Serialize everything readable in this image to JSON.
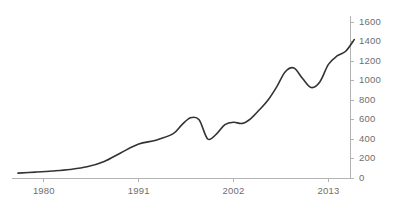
{
  "chart_data": {
    "type": "line",
    "title": "",
    "subtitle": "",
    "xlabel": "",
    "ylabel": "",
    "xlim": [
      1977,
      2015.5
    ],
    "ylim": [
      0,
      1600
    ],
    "grid": false,
    "legend": null,
    "legend_position": "none",
    "y_axis_side": "right",
    "x_ticks": [
      1980,
      1991,
      2002,
      2013
    ],
    "x_tick_labels": [
      "1980",
      "1991",
      "2002",
      "2013"
    ],
    "y_ticks": [
      0,
      200,
      400,
      600,
      800,
      1000,
      1200,
      1400,
      1600
    ],
    "y_tick_labels": [
      "0",
      "200",
      "400",
      "600",
      "800",
      "1000",
      "1200",
      "1400",
      "1600"
    ],
    "series": [
      {
        "name": "",
        "color": "#333333",
        "x": [
          1977,
          1978,
          1979,
          1980,
          1981,
          1982,
          1983,
          1984,
          1985,
          1986,
          1987,
          1988,
          1989,
          1990,
          1991,
          1992,
          1993,
          1994,
          1995,
          1996,
          1997,
          1998,
          1999,
          2000,
          2001,
          2002,
          2003,
          2004,
          2005,
          2006,
          2007,
          2008,
          2009,
          2010,
          2011,
          2012,
          2013,
          2014,
          2015
        ],
        "values": [
          50,
          55,
          62,
          70,
          76,
          82,
          90,
          100,
          118,
          145,
          180,
          225,
          275,
          320,
          352,
          372,
          392,
          420,
          462,
          540,
          612,
          600,
          425,
          392,
          500,
          565,
          578,
          572,
          620,
          720,
          830,
          960,
          1090,
          1128,
          1010,
          928,
          960,
          1105,
          1225
        ],
        "extra_x": [
          2016,
          2017
        ],
        "extra_values": [
          1278,
          1300
        ]
      }
    ],
    "series_full": {
      "points": [
        [
          1977,
          50
        ],
        [
          1979,
          60
        ],
        [
          1981,
          72
        ],
        [
          1983,
          88
        ],
        [
          1985,
          115
        ],
        [
          1987,
          170
        ],
        [
          1989,
          262
        ],
        [
          1991,
          348
        ],
        [
          1993,
          388
        ],
        [
          1995,
          455
        ],
        [
          1996,
          545
        ],
        [
          1997,
          618
        ],
        [
          1998,
          598
        ],
        [
          1999,
          400
        ],
        [
          2000,
          450
        ],
        [
          2001,
          548
        ],
        [
          2002,
          572
        ],
        [
          2003,
          560
        ],
        [
          2004,
          610
        ],
        [
          2005,
          700
        ],
        [
          2006,
          800
        ],
        [
          2007,
          935
        ],
        [
          2008,
          1090
        ],
        [
          2009,
          1128
        ],
        [
          2010,
          1020
        ],
        [
          2011,
          928
        ],
        [
          2012,
          985
        ],
        [
          2013,
          1165
        ],
        [
          2014,
          1252
        ],
        [
          2015,
          1300
        ],
        [
          2016,
          1420
        ]
      ]
    },
    "annotations": [],
    "line_color": "#333333",
    "axis_color": "#b3b3b3",
    "tick_label_color": "#6e6e6e",
    "background_color": "#ffffff"
  },
  "layout": {
    "plot_left": 18,
    "plot_right": 350,
    "plot_top": 22,
    "plot_bottom": 178,
    "x_pixel_ticks": [
      46,
      139,
      232,
      325
    ]
  }
}
